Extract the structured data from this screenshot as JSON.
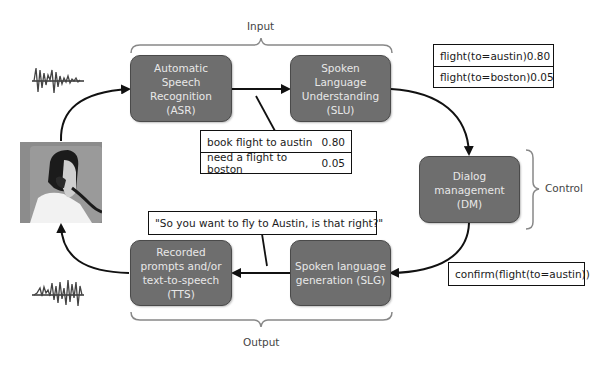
{
  "diagram": {
    "groups": {
      "input": "Input",
      "output": "Output",
      "control": "Control"
    },
    "nodes": {
      "asr": {
        "lines": [
          "Automatic",
          "Speech",
          "Recognition",
          "(ASR)"
        ]
      },
      "slu": {
        "lines": [
          "Spoken",
          "Language",
          "Understanding",
          "(SLU)"
        ]
      },
      "dm": {
        "lines": [
          "Dialog",
          "management",
          "(DM)"
        ]
      },
      "slg": {
        "lines": [
          "Spoken language",
          "generation (SLG)"
        ]
      },
      "tts": {
        "lines": [
          "Recorded",
          "prompts and/or",
          "text-to-speech",
          "(TTS)"
        ]
      }
    },
    "asr_nbest": [
      {
        "text": "book flight to austin",
        "score": "0.80"
      },
      {
        "text": "need a flight to boston",
        "score": "0.05"
      }
    ],
    "slu_nbest": [
      {
        "text": "flight(to=austin)",
        "score": "0.80"
      },
      {
        "text": "flight(to=boston)",
        "score": "0.05"
      }
    ],
    "dm_action": "confirm(flight(to=austin))",
    "slg_output": "\"So you want to fly to Austin, is that right?\"",
    "icons": {
      "waveform_in": "waveform-icon",
      "waveform_out": "waveform-icon",
      "user": "person-on-phone-image"
    },
    "colors": {
      "node_fill": "#6e6e6e",
      "node_text": "#e8e8e8",
      "arrow": "#111111",
      "brace": "#777777"
    }
  }
}
